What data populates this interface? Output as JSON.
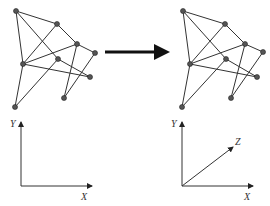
{
  "diagram": {
    "colors": {
      "edge": "#333333",
      "node": "#555555",
      "arrow": "#111111"
    },
    "left": {
      "nodes": {
        "A": [
          16,
          11
        ],
        "B": [
          57,
          24
        ],
        "C": [
          77,
          44
        ],
        "D": [
          95,
          53
        ],
        "E": [
          23,
          64
        ],
        "F": [
          58,
          59
        ],
        "G": [
          90,
          77
        ],
        "H": [
          64,
          98
        ],
        "I": [
          15,
          107
        ]
      },
      "axes": {
        "x_label": "X",
        "y_label": "Y"
      }
    },
    "right": {
      "nodes": {
        "A": [
          183,
          11
        ],
        "B": [
          225,
          24
        ],
        "C": [
          245,
          44
        ],
        "D": [
          263,
          52
        ],
        "E": [
          190,
          64
        ],
        "F": [
          226,
          59
        ],
        "G": [
          257,
          77
        ],
        "H": [
          231,
          98
        ],
        "I": [
          182,
          107
        ]
      },
      "axes": {
        "x_label": "X",
        "y_label": "Y",
        "z_label": "Z"
      }
    },
    "edges": [
      [
        "A",
        "B"
      ],
      [
        "A",
        "E"
      ],
      [
        "A",
        "F"
      ],
      [
        "F",
        "G"
      ],
      [
        "B",
        "C"
      ],
      [
        "B",
        "E"
      ],
      [
        "C",
        "D"
      ],
      [
        "C",
        "E"
      ],
      [
        "C",
        "H"
      ],
      [
        "D",
        "H"
      ],
      [
        "E",
        "G"
      ],
      [
        "F",
        "I"
      ],
      [
        "E",
        "I"
      ]
    ]
  }
}
